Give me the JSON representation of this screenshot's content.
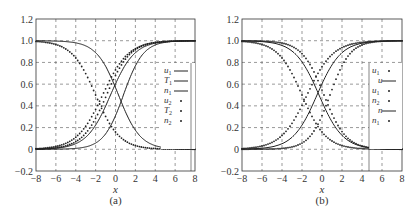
{
  "chart_data": [
    {
      "type": "line",
      "caption": "(a)",
      "xlabel": "x",
      "ylabel": "",
      "xlim": [
        -8,
        8
      ],
      "ylim": [
        -0.2,
        1.2
      ],
      "xticks": [
        "-8",
        "-6",
        "-4",
        "-2",
        "0",
        "2",
        "4",
        "6",
        "8"
      ],
      "yticks": [
        "-0.2",
        "0",
        "0.2",
        "0.4",
        "0.6",
        "0.8",
        "1.0",
        "1.2"
      ],
      "grid": true,
      "legend_position": "right-middle",
      "series": [
        {
          "name": "u1",
          "style": "solid",
          "shape": "decreasing",
          "center": 0.3,
          "width": 1.1
        },
        {
          "name": "T1",
          "style": "solid",
          "shape": "increasing",
          "center": -0.5,
          "width": 1.2
        },
        {
          "name": "n1",
          "style": "solid",
          "shape": "increasing",
          "center": 0.8,
          "width": 1.0
        },
        {
          "name": "u2",
          "style": "dotted",
          "shape": "decreasing",
          "center": -2.0,
          "width": 1.2
        },
        {
          "name": "T2",
          "style": "dotted",
          "shape": "increasing",
          "center": -1.3,
          "width": 1.3
        },
        {
          "name": "n2",
          "style": "dotted",
          "shape": "increasing",
          "center": -0.9,
          "width": 1.2
        }
      ]
    },
    {
      "type": "line",
      "caption": "(b)",
      "xlabel": "x",
      "ylabel": "",
      "xlim": [
        -8,
        8
      ],
      "ylim": [
        -0.2,
        1.2
      ],
      "xticks": [
        "-8",
        "-6",
        "-4",
        "-2",
        "0",
        "2",
        "4",
        "6",
        "8"
      ],
      "yticks": [
        "-0.2",
        "0",
        "0.2",
        "0.4",
        "0.6",
        "0.8",
        "1.0",
        "1.2"
      ],
      "grid": true,
      "legend_position": "right-middle",
      "series": [
        {
          "name": "u1",
          "style": "dotted",
          "shape": "decreasing",
          "center": -2.0,
          "width": 1.2
        },
        {
          "name": "u",
          "style": "solid",
          "shape": "decreasing",
          "center": -0.3,
          "width": 1.2
        },
        {
          "name": "u1",
          "style": "dotted",
          "shape": "decreasing",
          "center": 0.2,
          "width": 1.1
        },
        {
          "name": "n2",
          "style": "dotted",
          "shape": "increasing",
          "center": -1.5,
          "width": 1.3
        },
        {
          "name": "n",
          "style": "solid",
          "shape": "increasing",
          "center": -0.5,
          "width": 1.2
        },
        {
          "name": "n1",
          "style": "dotted",
          "shape": "increasing",
          "center": 0.8,
          "width": 1.0
        }
      ]
    }
  ],
  "figure": {
    "panels": [
      {
        "caption": "(a)",
        "xlabel": "x",
        "legend": [
          {
            "label": "u",
            "sub": "1",
            "marker": "line"
          },
          {
            "label": "T",
            "sub": "1",
            "marker": "line"
          },
          {
            "label": "n",
            "sub": "1",
            "marker": "line"
          },
          {
            "label": "u",
            "sub": "2",
            "marker": "dot"
          },
          {
            "label": "T",
            "sub": "2",
            "marker": "dot"
          },
          {
            "label": "n",
            "sub": "2",
            "marker": "dot"
          }
        ]
      },
      {
        "caption": "(b)",
        "xlabel": "x",
        "legend": [
          {
            "label": "u",
            "sub": "1",
            "marker": "dot"
          },
          {
            "label": "u",
            "sub": "",
            "marker": "line"
          },
          {
            "label": "u",
            "sub": "1",
            "marker": "dot"
          },
          {
            "label": "n",
            "sub": "2",
            "marker": "dot"
          },
          {
            "label": "n",
            "sub": "",
            "marker": "line"
          },
          {
            "label": "n",
            "sub": "1",
            "marker": "dot"
          }
        ]
      }
    ],
    "colors": {
      "line": "#222222",
      "grid": "#555555",
      "axis": "#333333",
      "background": "#ffffff"
    }
  }
}
